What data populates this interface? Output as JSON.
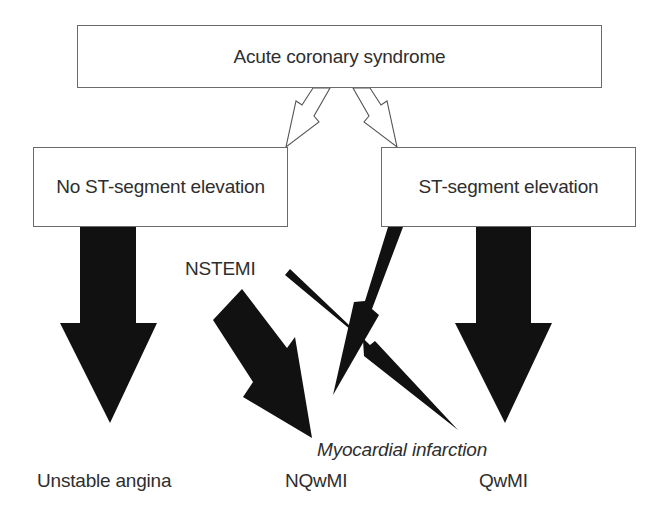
{
  "diagram": {
    "type": "flowchart",
    "nodes": {
      "root": {
        "label": "Acute coronary syndrome"
      },
      "left": {
        "label": "No ST-segment elevation"
      },
      "right": {
        "label": "ST-segment elevation"
      }
    },
    "labels": {
      "nstemi": "NSTEMI",
      "myocardial_infarction": "Myocardial infarction",
      "unstable_angina": "Unstable angina",
      "nqwmi": "NQwMI",
      "qwmi": "QwMI"
    },
    "edges": [
      {
        "from": "Acute coronary syndrome",
        "to": "No ST-segment elevation",
        "style": "hollow-zigzag-arrow"
      },
      {
        "from": "Acute coronary syndrome",
        "to": "ST-segment elevation",
        "style": "hollow-zigzag-arrow"
      },
      {
        "from": "No ST-segment elevation",
        "to": "Unstable angina",
        "style": "thick-black-arrow"
      },
      {
        "from": "No ST-segment elevation",
        "to": "NQwMI",
        "style": "thick-black-arrow",
        "label": "NSTEMI"
      },
      {
        "from": "No ST-segment elevation",
        "to": "QwMI",
        "style": "thin-zigzag-black-arrow"
      },
      {
        "from": "ST-segment elevation",
        "to": "NQwMI",
        "style": "thin-zigzag-black-arrow"
      },
      {
        "from": "ST-segment elevation",
        "to": "QwMI",
        "style": "thick-black-arrow"
      }
    ],
    "colors": {
      "arrow_fill": "#111111",
      "box_border": "#6a6a6a",
      "text": "#2e2e2e",
      "background": "#ffffff"
    }
  }
}
